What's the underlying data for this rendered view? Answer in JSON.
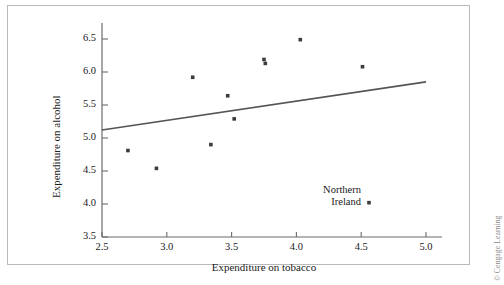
{
  "chart_data": {
    "type": "scatter",
    "title": "",
    "xlabel": "Expenditure on tobacco",
    "ylabel": "Expenditure on alcohol",
    "xlim": [
      2.5,
      5.0
    ],
    "ylim": [
      3.5,
      6.5
    ],
    "xticks": [
      "2.5",
      "3.0",
      "3.5",
      "4.0",
      "4.5",
      "5.0"
    ],
    "yticks": [
      "3.5",
      "4.0",
      "4.5",
      "5.0",
      "5.5",
      "6.0",
      "6.5"
    ],
    "grid": false,
    "legend": "none",
    "points": [
      {
        "x": 2.7,
        "y": 4.81
      },
      {
        "x": 2.92,
        "y": 4.54
      },
      {
        "x": 3.2,
        "y": 5.92
      },
      {
        "x": 3.34,
        "y": 4.9
      },
      {
        "x": 3.47,
        "y": 5.64
      },
      {
        "x": 3.52,
        "y": 5.29
      },
      {
        "x": 3.75,
        "y": 6.19
      },
      {
        "x": 3.76,
        "y": 6.13
      },
      {
        "x": 4.03,
        "y": 6.49
      },
      {
        "x": 4.51,
        "y": 6.08
      },
      {
        "x": 4.56,
        "y": 4.02
      }
    ],
    "series": [
      {
        "name": "regression line",
        "type": "line",
        "x": [
          2.5,
          5.0
        ],
        "values": [
          5.12,
          5.85
        ]
      }
    ],
    "annotations": [
      {
        "name": "northern-ireland",
        "line1": "Northern",
        "line2": "Ireland",
        "points_to": {
          "x": 4.56,
          "y": 4.02
        }
      }
    ]
  },
  "figure": {
    "copyright": "© Cengage Learning"
  }
}
